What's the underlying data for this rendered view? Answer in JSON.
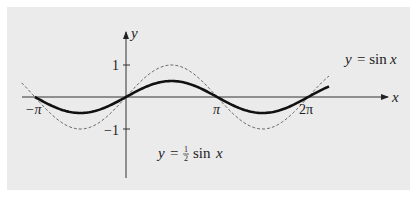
{
  "chart_data": {
    "type": "line",
    "title": "",
    "xlabel": "x",
    "ylabel": "y",
    "x_ticks": [
      "−π",
      "π",
      "2π"
    ],
    "x_tick_values": [
      -3.1416,
      3.1416,
      6.2832
    ],
    "y_ticks": [
      "1",
      "−1"
    ],
    "y_tick_values": [
      1,
      -1
    ],
    "xlim": [
      -3.6,
      7.2
    ],
    "ylim": [
      -1.6,
      1.9
    ],
    "grid": false,
    "legend": "none (inline labels)",
    "series": [
      {
        "name": "y = sin x",
        "style": "dashed thin",
        "x": [
          -3.6,
          -3.1416,
          -1.5708,
          0,
          1.5708,
          3.1416,
          4.7124,
          6.2832,
          7.0
        ],
        "values": [
          0.44,
          0,
          -1,
          0,
          1,
          0,
          -1,
          0,
          0.66
        ]
      },
      {
        "name": "y = ½ sin x",
        "style": "solid thick",
        "x": [
          -3.1416,
          -1.5708,
          0,
          1.5708,
          3.1416,
          4.7124,
          6.2832,
          7.0
        ],
        "values": [
          0,
          -0.5,
          0,
          0.5,
          0,
          -0.5,
          0,
          0.33
        ]
      }
    ],
    "annotations": [
      {
        "text": "y = sin x",
        "position": "upper right near dashed curve"
      },
      {
        "text": "y = ½ sin x",
        "position": "lower center below axis"
      }
    ]
  },
  "labels": {
    "x_axis": "x",
    "y_axis": "y",
    "tick_neg_pi": "−π",
    "tick_pi": "π",
    "tick_2pi": "2π",
    "tick_one": "1",
    "tick_neg_one": "−1",
    "sin_label_y": "y",
    "sin_label_eq": "= sin",
    "sin_label_x": "x",
    "half_label_y": "y",
    "half_label_eq": "=",
    "half_label_num": "1",
    "half_label_den": "2",
    "half_label_sin": "sin",
    "half_label_x": "x"
  },
  "colors": {
    "panel": "#ebebeb",
    "ink": "#222222"
  }
}
